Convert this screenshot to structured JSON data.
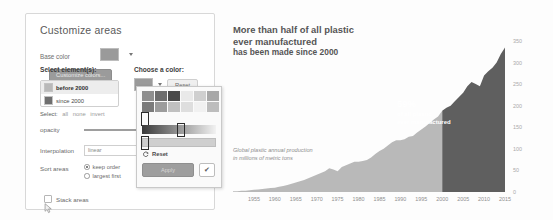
{
  "panel": {
    "title": "Customize areas",
    "base_color_label": "Base color",
    "customize_colors_button": "Customize colors...",
    "select_elements_label": "Select element(s):",
    "choose_color_label": "Choose a color:",
    "reset_button": "Reset",
    "elements": [
      {
        "label": "before 2000",
        "color": "#b9b9b9",
        "selected": true
      },
      {
        "label": "since 2000",
        "color": "#6f6f6f",
        "selected": false
      }
    ],
    "select_row": {
      "label": "Select:",
      "all": "all",
      "none": "none",
      "invert": "invert"
    },
    "opacity_label": "opacity",
    "interpolation_label": "Interpolation",
    "interpolation_value": "linear",
    "sort_label": "Sort areas",
    "sort_options": [
      {
        "label": "keep order",
        "selected": true
      },
      {
        "label": "largest first",
        "selected": false
      }
    ],
    "stack_areas_label": "Stack areas",
    "stack_areas_checked": false,
    "base_color": "#9a9a9a"
  },
  "popover": {
    "reset_label": "Reset",
    "apply_button": "Apply",
    "ok_button": "✔",
    "swatches": [
      "#8f8f8f",
      "#6d6d6d",
      "#4a4a4a",
      "#e9e9e9",
      "#cfcfcf",
      "#a8a8a8",
      "#7b7b7b",
      "#9c9c9c",
      "#c0c0c0",
      "#dedede",
      "#f1f1f1",
      "#bdbdbd"
    ],
    "gradient_from": "#3a3a3a",
    "gradient_to": "#f2f2f2"
  },
  "chart_data": {
    "type": "area",
    "title_line1": "More than half of all plastic",
    "title_line2": "ever manufactured",
    "title_line3": "has been made since 2000",
    "subtitle_line1": "Global plastic annual production",
    "subtitle_line2": "in millions of metric tons",
    "xlabel": "",
    "ylabel": "",
    "ylim": [
      0,
      380
    ],
    "yticks": [
      0,
      50,
      100,
      150,
      200,
      250,
      300,
      350
    ],
    "xticks": [
      1955,
      1960,
      1965,
      1970,
      1975,
      1980,
      1985,
      1990,
      1995,
      2000,
      2005,
      2010,
      2015
    ],
    "xlim": [
      1950,
      2015
    ],
    "grid": false,
    "legend": "none",
    "annotation": {
      "percent": "59%",
      "line1": "of all plastic",
      "line2": "ever manufactured",
      "split_year": 2000
    },
    "series": [
      {
        "name": "before 2000",
        "color": "#b9b9b9"
      },
      {
        "name": "since 2000",
        "color": "#5f5f5f"
      }
    ],
    "x": [
      1950,
      1951,
      1952,
      1953,
      1954,
      1955,
      1956,
      1957,
      1958,
      1959,
      1960,
      1961,
      1962,
      1963,
      1964,
      1965,
      1966,
      1967,
      1968,
      1969,
      1970,
      1971,
      1972,
      1973,
      1974,
      1975,
      1976,
      1977,
      1978,
      1979,
      1980,
      1981,
      1982,
      1983,
      1984,
      1985,
      1986,
      1987,
      1988,
      1989,
      1990,
      1991,
      1992,
      1993,
      1994,
      1995,
      1996,
      1997,
      1998,
      1999,
      2000,
      2001,
      2002,
      2003,
      2004,
      2005,
      2006,
      2007,
      2008,
      2009,
      2010,
      2011,
      2012,
      2013,
      2014,
      2015
    ],
    "values": [
      2,
      2,
      3,
      3,
      4,
      5,
      6,
      7,
      8,
      9,
      10,
      12,
      14,
      16,
      19,
      22,
      25,
      28,
      32,
      36,
      40,
      44,
      48,
      55,
      52,
      48,
      58,
      62,
      66,
      70,
      70,
      72,
      74,
      80,
      88,
      95,
      100,
      108,
      115,
      120,
      120,
      122,
      128,
      130,
      138,
      145,
      152,
      160,
      168,
      175,
      188,
      195,
      200,
      210,
      220,
      230,
      245,
      255,
      250,
      245,
      270,
      280,
      288,
      300,
      320,
      335
    ],
    "values_labels": "Global plastic annual production, millions of metric tons"
  }
}
